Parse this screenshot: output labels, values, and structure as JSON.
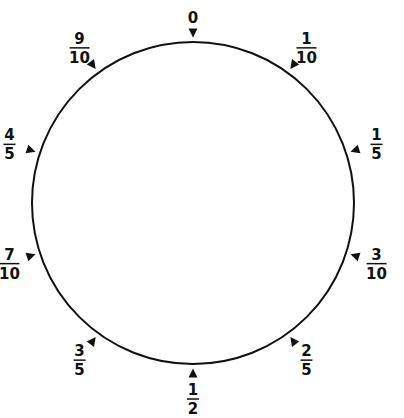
{
  "diagram": {
    "marks": [
      {
        "label": "0",
        "numerator": "0",
        "denominator": "",
        "fraction_of_turn": 0.0
      },
      {
        "label": "1/10",
        "numerator": "1",
        "denominator": "10",
        "fraction_of_turn": 0.1
      },
      {
        "label": "1/5",
        "numerator": "1",
        "denominator": "5",
        "fraction_of_turn": 0.2
      },
      {
        "label": "3/10",
        "numerator": "3",
        "denominator": "10",
        "fraction_of_turn": 0.3
      },
      {
        "label": "2/5",
        "numerator": "2",
        "denominator": "5",
        "fraction_of_turn": 0.4
      },
      {
        "label": "1/2",
        "numerator": "1",
        "denominator": "2",
        "fraction_of_turn": 0.5
      },
      {
        "label": "3/5",
        "numerator": "3",
        "denominator": "5",
        "fraction_of_turn": 0.6
      },
      {
        "label": "7/10",
        "numerator": "7",
        "denominator": "10",
        "fraction_of_turn": 0.7
      },
      {
        "label": "4/5",
        "numerator": "4",
        "denominator": "5",
        "fraction_of_turn": 0.8
      },
      {
        "label": "9/10",
        "numerator": "9",
        "denominator": "10",
        "fraction_of_turn": 0.9
      }
    ],
    "colors": {
      "stroke": "#111111",
      "background": "#ffffff"
    }
  }
}
